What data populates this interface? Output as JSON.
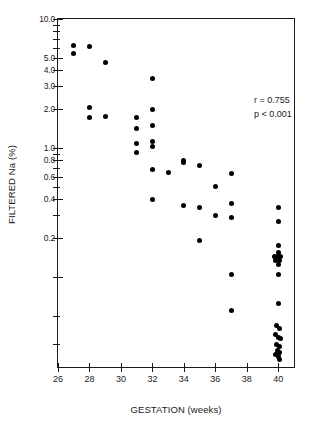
{
  "chart_data": {
    "type": "scatter",
    "title": "",
    "xlabel": "GESTATION (weeks)",
    "ylabel": "FILTERED Na (%)",
    "xlim": [
      26,
      41
    ],
    "ylim": [
      0.02,
      10.0
    ],
    "yscale": "log",
    "grid": false,
    "legend": null,
    "xticks": [
      26,
      28,
      30,
      32,
      34,
      36,
      38,
      40
    ],
    "xticklabels": [
      "26",
      "28",
      "30",
      "32",
      "34",
      "36",
      "38",
      "40"
    ],
    "yticks": [
      10.0,
      5.0,
      4.0,
      3.0,
      2.0,
      1.0,
      0.8,
      0.6,
      0.4,
      0.2,
      0.1
    ],
    "yticklabels": [
      "10.0",
      "5.0",
      "4.0",
      "3.0",
      "2.0",
      "1.0",
      "0.8",
      "0.6",
      "0.4",
      "0.2",
      ""
    ],
    "annotations": [
      {
        "text": "r = 0.755"
      },
      {
        "text": "p < 0.001"
      }
    ],
    "correlation_r": "0.755",
    "p_value": "p < 0.001",
    "n_points": 56,
    "points": [
      {
        "x": 27.0,
        "y": 6.2
      },
      {
        "x": 27.0,
        "y": 5.4
      },
      {
        "x": 28.0,
        "y": 6.1
      },
      {
        "x": 29.0,
        "y": 4.6
      },
      {
        "x": 28.0,
        "y": 2.05
      },
      {
        "x": 28.0,
        "y": 1.72
      },
      {
        "x": 29.0,
        "y": 1.75
      },
      {
        "x": 31.0,
        "y": 1.72
      },
      {
        "x": 31.0,
        "y": 1.42
      },
      {
        "x": 31.0,
        "y": 1.08
      },
      {
        "x": 31.0,
        "y": 0.92
      },
      {
        "x": 32.0,
        "y": 3.45
      },
      {
        "x": 32.0,
        "y": 2.0
      },
      {
        "x": 32.0,
        "y": 1.48
      },
      {
        "x": 32.0,
        "y": 1.12
      },
      {
        "x": 32.0,
        "y": 1.02
      },
      {
        "x": 32.0,
        "y": 0.68
      },
      {
        "x": 32.0,
        "y": 0.4
      },
      {
        "x": 33.0,
        "y": 0.645
      },
      {
        "x": 34.0,
        "y": 0.805
      },
      {
        "x": 34.0,
        "y": 0.775
      },
      {
        "x": 34.0,
        "y": 0.355
      },
      {
        "x": 35.0,
        "y": 0.73
      },
      {
        "x": 35.0,
        "y": 0.345
      },
      {
        "x": 35.0,
        "y": 0.19
      },
      {
        "x": 36.0,
        "y": 0.5
      },
      {
        "x": 36.0,
        "y": 0.3
      },
      {
        "x": 37.0,
        "y": 0.635
      },
      {
        "x": 37.0,
        "y": 0.37
      },
      {
        "x": 37.0,
        "y": 0.29
      },
      {
        "x": 37.0,
        "y": 0.105
      },
      {
        "x": 37.0,
        "y": 0.055
      },
      {
        "x": 40.0,
        "y": 0.345
      },
      {
        "x": 40.0,
        "y": 0.27
      },
      {
        "x": 40.0,
        "y": 0.175
      },
      {
        "x": 40.0,
        "y": 0.155
      },
      {
        "x": 39.75,
        "y": 0.145
      },
      {
        "x": 39.95,
        "y": 0.145
      },
      {
        "x": 40.15,
        "y": 0.145
      },
      {
        "x": 39.85,
        "y": 0.135
      },
      {
        "x": 40.05,
        "y": 0.135
      },
      {
        "x": 40.0,
        "y": 0.125
      },
      {
        "x": 40.0,
        "y": 0.105
      },
      {
        "x": 40.0,
        "y": 0.062
      },
      {
        "x": 39.9,
        "y": 0.042
      },
      {
        "x": 40.05,
        "y": 0.04
      },
      {
        "x": 39.8,
        "y": 0.036
      },
      {
        "x": 40.0,
        "y": 0.034
      },
      {
        "x": 40.15,
        "y": 0.033
      },
      {
        "x": 39.88,
        "y": 0.03
      },
      {
        "x": 40.05,
        "y": 0.029
      },
      {
        "x": 39.95,
        "y": 0.027
      },
      {
        "x": 40.1,
        "y": 0.026
      },
      {
        "x": 39.82,
        "y": 0.025
      },
      {
        "x": 40.0,
        "y": 0.024
      },
      {
        "x": 40.08,
        "y": 0.023
      }
    ]
  }
}
